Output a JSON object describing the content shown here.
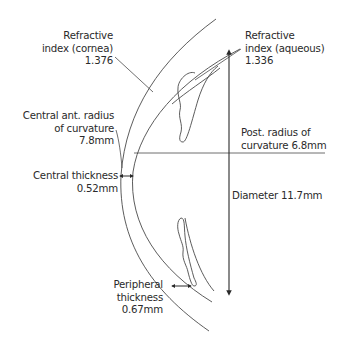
{
  "diagram": {
    "colors": {
      "line": "#4a4a4a",
      "text": "#2a2a2a",
      "background": "#ffffff"
    },
    "labels": {
      "refractive_cornea": {
        "line1": "Refractive",
        "line2": "index (cornea)",
        "line3": "1.376"
      },
      "refractive_aqueous": {
        "line1": "Refractive",
        "line2": "index (aqueous)",
        "line3": "1.336"
      },
      "central_ant_radius": {
        "line1": "Central ant. radius",
        "line2": "of curvature",
        "line3": "7.8mm"
      },
      "post_radius": {
        "line1": "Post. radius of",
        "line2": "curvature 6.8mm"
      },
      "central_thickness": {
        "line1": "Central thickness",
        "line2": "0.52mm"
      },
      "diameter": {
        "line1": "Diameter 11.7mm"
      },
      "peripheral_thickness": {
        "line1": "Peripheral",
        "line2": "thickness",
        "line3": "0.67mm"
      }
    }
  }
}
